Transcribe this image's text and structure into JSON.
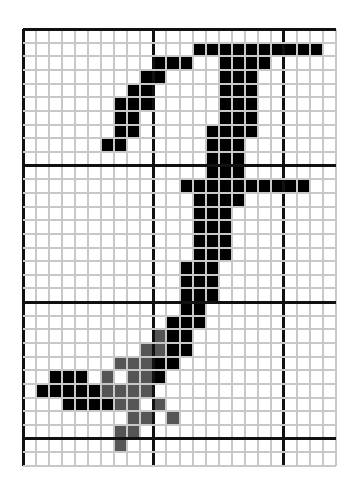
{
  "figure": {
    "cols": 24,
    "rows": 32,
    "thick_cols": [
      0,
      10,
      20
    ],
    "thick_rows": [
      0,
      10,
      20,
      30
    ],
    "colors": {
      "black": "#000000",
      "gray": "#555555",
      "grid_line": "#c8c8c8",
      "major_line": "#111111",
      "background": "#ffffff"
    },
    "black_cells": {
      "1": [
        13,
        14,
        15,
        16,
        17,
        18,
        19,
        20,
        21,
        22
      ],
      "2": [
        10,
        11,
        12,
        15,
        16,
        17,
        18
      ],
      "3": [
        9,
        10,
        15,
        16,
        17
      ],
      "4": [
        8,
        9,
        15,
        16,
        17
      ],
      "5": [
        7,
        8,
        9,
        15,
        16,
        17
      ],
      "6": [
        7,
        8,
        15,
        16,
        17
      ],
      "7": [
        7,
        8,
        14,
        15,
        16,
        17
      ],
      "8": [
        6,
        7,
        14,
        15,
        16
      ],
      "9": [
        14,
        15,
        16
      ],
      "10": [
        14,
        15,
        16
      ],
      "11": [
        12,
        13,
        14,
        15,
        16,
        17,
        18,
        19,
        20,
        21
      ],
      "12": [
        13,
        14,
        15,
        16
      ],
      "13": [
        13,
        14,
        15
      ],
      "14": [
        13,
        14,
        15
      ],
      "15": [
        13,
        14,
        15
      ],
      "16": [
        13,
        14,
        15
      ],
      "17": [
        12,
        13,
        14
      ],
      "18": [
        12,
        13,
        14
      ],
      "19": [
        12,
        13,
        14
      ],
      "20": [
        12,
        13
      ],
      "21": [
        11,
        12,
        13
      ],
      "22": [
        11,
        12
      ],
      "23": [
        11,
        12
      ],
      "24": [
        10,
        11
      ],
      "25": [
        2,
        3,
        4,
        10
      ],
      "26": [
        1,
        2,
        3,
        4,
        5
      ],
      "27": [
        3,
        4,
        5,
        6
      ]
    },
    "gray_cells": {
      "22": [
        10
      ],
      "23": [
        9,
        10
      ],
      "24": [
        7,
        8,
        9
      ],
      "25": [
        6,
        8,
        9
      ],
      "26": [
        6,
        7,
        8,
        9
      ],
      "27": [
        7,
        8,
        10
      ],
      "28": [
        8,
        9,
        11
      ],
      "29": [
        7,
        8
      ],
      "30": [
        7
      ]
    }
  }
}
